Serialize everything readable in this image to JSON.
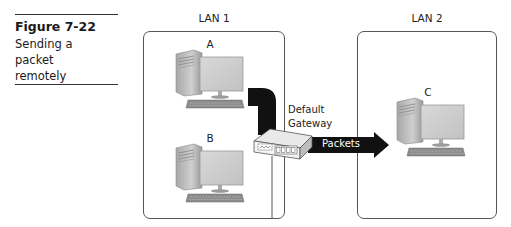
{
  "figure": {
    "number": "Figure 7-22",
    "caption_lines": [
      "Sending a",
      "packet",
      "remotely"
    ]
  },
  "lans": [
    {
      "label": "LAN 1",
      "computers": [
        "A",
        "B"
      ]
    },
    {
      "label": "LAN 2",
      "computers": [
        "C"
      ]
    }
  ],
  "gateway": {
    "label_line1": "Default",
    "label_line2": "Gateway",
    "icon": "router-icon"
  },
  "arrow": {
    "label": "Packets",
    "color": "#111111"
  },
  "colors": {
    "box_border": "#555555",
    "cable": "#111111",
    "computer_gray": "#bdbdbd"
  }
}
